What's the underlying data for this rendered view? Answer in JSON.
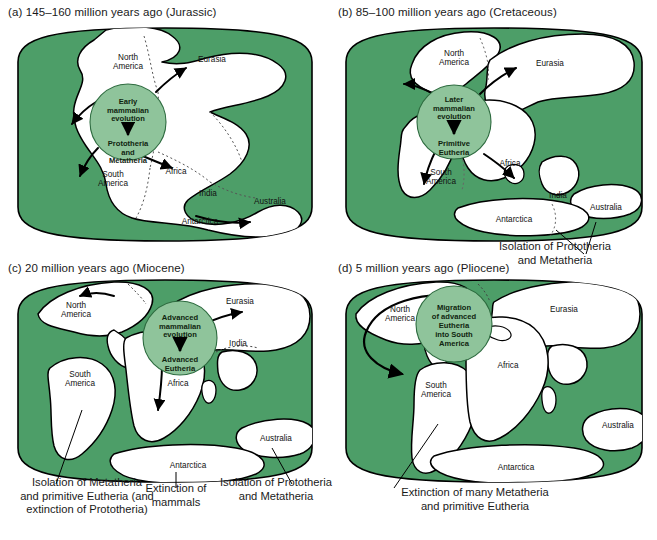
{
  "figure": {
    "background": "#ffffff",
    "ocean_color": "#4d9e68",
    "land_color": "#ffffff",
    "circle_color": "#8fc49b",
    "outline_color": "#000000"
  },
  "panels": [
    {
      "id": "a",
      "title": "(a) 145–160 million years ago (Jurassic)",
      "circle": {
        "top_text": [
          "Early",
          "mammalian",
          "evolution"
        ],
        "bottom_text": [
          "Prototheria",
          "and",
          "Metatheria"
        ]
      },
      "continents": [
        {
          "name": "North",
          "name2": "America"
        },
        {
          "name": "Eurasia"
        },
        {
          "name": "South",
          "name2": "America"
        },
        {
          "name": "Africa"
        },
        {
          "name": "India"
        },
        {
          "name": "Australia"
        },
        {
          "name": "Antarctica"
        }
      ],
      "captions": []
    },
    {
      "id": "b",
      "title": "(b) 85–100 million years ago (Cretaceous)",
      "circle": {
        "top_text": [
          "Later",
          "mammalian",
          "evolution"
        ],
        "bottom_text": [
          "Primitive",
          "Eutheria"
        ]
      },
      "continents": [
        {
          "name": "North",
          "name2": "America"
        },
        {
          "name": "Eurasia"
        },
        {
          "name": "South",
          "name2": "America"
        },
        {
          "name": "Africa"
        },
        {
          "name": "India"
        },
        {
          "name": "Australia"
        },
        {
          "name": "Antarctica"
        }
      ],
      "captions": [
        {
          "lines": [
            "Isolation of Prototheria",
            "and Metatheria"
          ]
        }
      ]
    },
    {
      "id": "c",
      "title": "(c) 20 million years ago (Miocene)",
      "circle": {
        "top_text": [
          "Advanced",
          "mammalian",
          "evolution"
        ],
        "bottom_text": [
          "Advanced",
          "Eutheria"
        ]
      },
      "continents": [
        {
          "name": "North",
          "name2": "America"
        },
        {
          "name": "Eurasia"
        },
        {
          "name": "South",
          "name2": "America"
        },
        {
          "name": "Africa"
        },
        {
          "name": "India"
        },
        {
          "name": "Australia"
        },
        {
          "name": "Antarctica"
        }
      ],
      "captions": [
        {
          "lines": [
            "Isolation of Metatheria",
            "and primitive Eutheria (and",
            "extinction of Prototheria)"
          ]
        },
        {
          "lines": [
            "Extinction of",
            "mammals"
          ]
        },
        {
          "lines": [
            "Isolation of Prototheria",
            "and Metatheria"
          ]
        }
      ]
    },
    {
      "id": "d",
      "title": "(d) 5 million years ago (Pliocene)",
      "circle": {
        "top_text": [
          "Migration",
          "of advanced",
          "Eutheria",
          "into South",
          "America"
        ],
        "bottom_text": []
      },
      "continents": [
        {
          "name": "North",
          "name2": "America"
        },
        {
          "name": "Eurasia"
        },
        {
          "name": "South",
          "name2": "America"
        },
        {
          "name": "Africa"
        },
        {
          "name": "Australia"
        },
        {
          "name": "Antarctica"
        }
      ],
      "captions": [
        {
          "lines": [
            "Extinction of many Metatheria",
            "and primitive Eutheria"
          ]
        }
      ]
    }
  ]
}
